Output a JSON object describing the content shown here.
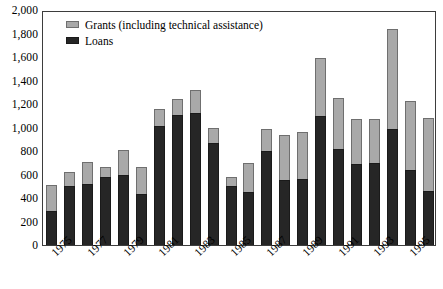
{
  "chart_data": {
    "type": "bar",
    "stacked": true,
    "title": "",
    "subtitle": "",
    "xlabel": "",
    "ylabel": "",
    "ylim": [
      0,
      2000
    ],
    "ytick_step": 200,
    "ytick_labels": [
      "0",
      "200",
      "400",
      "600",
      "800",
      "1,000",
      "1,200",
      "1,400",
      "1,600",
      "1,800",
      "2,000"
    ],
    "ytick_values": [
      0,
      200,
      400,
      600,
      800,
      1000,
      1200,
      1400,
      1600,
      1800,
      2000
    ],
    "grid": false,
    "legend_position": "top-left-inside",
    "categories": [
      "1975",
      "1976",
      "1977",
      "1978",
      "1979",
      "1980",
      "1981",
      "1982",
      "1983",
      "1984",
      "1985",
      "1986",
      "1987",
      "1988",
      "1989",
      "1990",
      "1991",
      "1992",
      "1993",
      "1994",
      "1995",
      "1996"
    ],
    "xtick_labels_shown": [
      "1975",
      "1977",
      "1979",
      "1981",
      "1983",
      "1985",
      "1987",
      "1989",
      "1991",
      "1993",
      "1995"
    ],
    "xtick_label_indices": [
      0,
      2,
      4,
      6,
      8,
      10,
      12,
      14,
      16,
      18,
      20
    ],
    "series": [
      {
        "name": "Loans",
        "color": "#262626",
        "values": [
          290,
          500,
          520,
          580,
          600,
          430,
          1010,
          1110,
          1125,
          870,
          500,
          450,
          800,
          550,
          560,
          1100,
          820,
          690,
          700,
          990,
          640,
          460
        ]
      },
      {
        "name": "Grants (including technical assistance)",
        "color": "#a9a9a9",
        "values": [
          220,
          120,
          190,
          80,
          210,
          230,
          150,
          130,
          195,
          130,
          80,
          250,
          190,
          390,
          400,
          490,
          435,
          380,
          375,
          850,
          585,
          620
        ]
      }
    ],
    "totals": [
      510,
      620,
      710,
      660,
      810,
      660,
      1160,
      1240,
      1320,
      1000,
      580,
      700,
      990,
      940,
      960,
      1590,
      1255,
      1070,
      1075,
      1840,
      1225,
      1080
    ]
  },
  "legend": {
    "entries": [
      {
        "label": "Grants (including technical assistance)",
        "swatch": "grants"
      },
      {
        "label": "Loans",
        "swatch": "loans"
      }
    ]
  }
}
